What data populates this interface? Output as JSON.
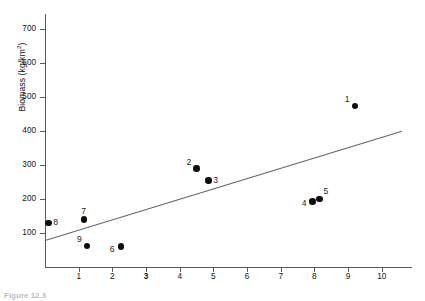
{
  "figure": {
    "caption": "Figure 12.3",
    "y_axis_title_main": "Biomass (kg/km",
    "y_axis_title_sup": "2",
    "y_axis_title_tail": ")",
    "x_axis_title": "Abundance of legumes (% of trees)"
  },
  "chart_data": {
    "type": "scatter",
    "title": "",
    "xlabel": "Abundance of legumes (% of trees)",
    "ylabel": "Biomass (kg/km2)",
    "xlim": [
      0,
      10.9
    ],
    "ylim": [
      0,
      745
    ],
    "grid": false,
    "legend_position": "none",
    "x_ticks": [
      1,
      2,
      3,
      4,
      5,
      6,
      7,
      8,
      9,
      10
    ],
    "x_tick_labels": [
      "1",
      "2",
      "3",
      "4",
      "5",
      "6",
      "7",
      "8",
      "9",
      "10"
    ],
    "x_tick_bold": [
      "3"
    ],
    "y_ticks": [
      100,
      200,
      300,
      400,
      500,
      600,
      700
    ],
    "y_tick_labels": [
      "100",
      "200",
      "300",
      "400",
      "500",
      "600",
      "700"
    ],
    "point_labels": [
      "1",
      "2",
      "3",
      "4",
      "5",
      "6",
      "7",
      "8",
      "9"
    ],
    "x": [
      9.2,
      4.5,
      4.85,
      7.95,
      8.15,
      2.25,
      1.15,
      0.1,
      1.25
    ],
    "y": [
      475,
      290,
      255,
      193,
      201,
      60,
      140,
      130,
      62
    ],
    "points": [
      {
        "label": "1",
        "x": 9.2,
        "y": 475,
        "label_pos": "above-left"
      },
      {
        "label": "2",
        "x": 4.5,
        "y": 290,
        "label_pos": "above-left"
      },
      {
        "label": "3",
        "x": 4.85,
        "y": 255,
        "label_pos": "right"
      },
      {
        "label": "4",
        "x": 7.95,
        "y": 193,
        "label_pos": "left"
      },
      {
        "label": "5",
        "x": 8.15,
        "y": 201,
        "label_pos": "above-right"
      },
      {
        "label": "6",
        "x": 2.25,
        "y": 60,
        "label_pos": "left"
      },
      {
        "label": "7",
        "x": 1.15,
        "y": 140,
        "label_pos": "above"
      },
      {
        "label": "8",
        "x": 0.1,
        "y": 130,
        "label_pos": "right"
      },
      {
        "label": "9",
        "x": 1.25,
        "y": 62,
        "label_pos": "above-left"
      }
    ],
    "trendline": {
      "type": "linear",
      "x_start": 0.0,
      "y_start": 78,
      "x_end": 10.6,
      "y_end": 400,
      "color": "#666666"
    },
    "marker_color": "#0d0d0d",
    "axis_color": "#5a5a5a"
  }
}
